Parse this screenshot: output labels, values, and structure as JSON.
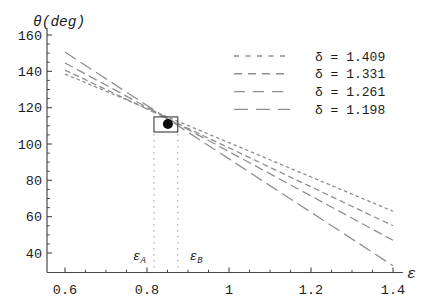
{
  "chart_data": {
    "type": "line",
    "title": "",
    "xlabel": "ε",
    "ylabel": "θ(deg)",
    "xlim": [
      0.6,
      1.4
    ],
    "ylim": [
      40,
      160
    ],
    "grid": false,
    "x_ticks": {
      "values": [
        0.6,
        0.8,
        1.0,
        1.2,
        1.4
      ],
      "labels": [
        "0.6",
        "0.8",
        "1",
        "1.2",
        "1.4"
      ],
      "minor_step": 0.05
    },
    "y_ticks": {
      "values": [
        40,
        60,
        80,
        100,
        120,
        140,
        160
      ],
      "labels": [
        "40",
        "60",
        "80",
        "100",
        "120",
        "140",
        "160"
      ],
      "minor_step": 5
    },
    "legend": {
      "position": "top-right",
      "entries": [
        "δ = 1.409",
        "δ = 1.331",
        "δ = 1.261",
        "δ = 1.198"
      ]
    },
    "series": [
      {
        "label": "δ = 1.409",
        "delta": 1.409,
        "x": [
          0.6,
          1.4
        ],
        "y": [
          138.5,
          63
        ],
        "dash": [
          3.5,
          2.8
        ],
        "legend_dash": [
          5,
          6.5
        ]
      },
      {
        "label": "δ = 1.331",
        "delta": 1.331,
        "x": [
          0.6,
          1.4
        ],
        "y": [
          140.7,
          55
        ],
        "dash": [
          6,
          3.5
        ],
        "legend_dash": [
          8,
          6
        ]
      },
      {
        "label": "δ = 1.261",
        "delta": 1.261,
        "x": [
          0.6,
          1.4
        ],
        "y": [
          144.6,
          47
        ],
        "dash": [
          9,
          4.5
        ],
        "legend_dash": [
          11,
          8
        ]
      },
      {
        "label": "δ = 1.198",
        "delta": 1.198,
        "x": [
          0.6,
          1.4
        ],
        "y": [
          150.6,
          33
        ],
        "dash": [
          13,
          5.5
        ],
        "legend_dash": [
          14,
          8
        ]
      }
    ],
    "annotations": {
      "crossing_point": {
        "x": 0.851,
        "y": 111
      },
      "crossing_box": {
        "x0": 0.817,
        "x1": 0.875,
        "y0": 106.6,
        "y1": 114.9
      },
      "guides": [
        {
          "x": 0.817,
          "label": "ε",
          "sub": "A",
          "side": "left",
          "theta_top": 105.5,
          "theta_bottom": 31
        },
        {
          "x": 0.875,
          "label": "ε",
          "sub": "B",
          "side": "right",
          "theta_top": 105.5,
          "theta_bottom": 31
        }
      ]
    },
    "colors": {
      "background": "#ffffff",
      "line": "#8f8f8f",
      "axis": "#474747",
      "text": "#1c1c1c",
      "marker": "#0d0d0d",
      "box": "#4a4a4a",
      "guide": "#999999"
    }
  }
}
